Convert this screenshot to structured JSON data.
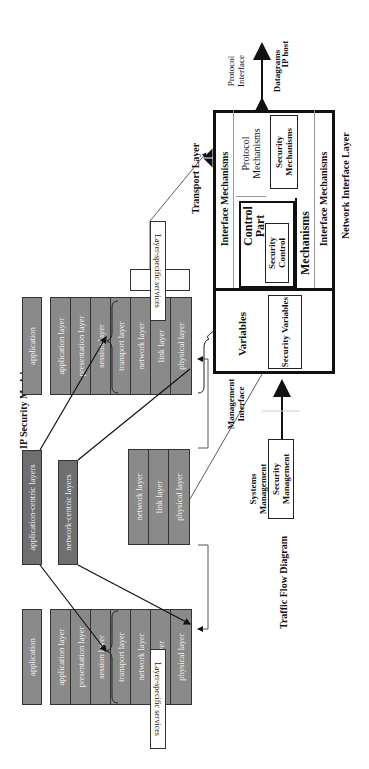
{
  "titles": {
    "security_model": "IP Security Model",
    "traffic_flow": "Traffic Flow Diagram"
  },
  "left_stack": {
    "application": "application",
    "layers": [
      "application layer",
      "presentation layer",
      "session layer",
      "transport layer",
      "network layer",
      "link layer",
      "physical layer"
    ],
    "services_label": "Layer-specific services"
  },
  "right_stack": {
    "application": "application",
    "layers": [
      "application layer",
      "presentation layer",
      "session layer",
      "transport layer",
      "network layer",
      "link layer",
      "physical layer"
    ],
    "services_label": "Layer-specific services"
  },
  "centric": {
    "application_centric": "application-centric layers",
    "network_centric": "network-centric layers"
  },
  "middle_stack": {
    "layers": [
      "network layer",
      "link layer",
      "physical layer"
    ]
  },
  "security_model": {
    "transport_layer": "Transport Layer",
    "network_interface_layer": "Network Interface Layer",
    "interface_mechanisms_top": "Interface Mechanisms",
    "interface_mechanisms_bottom": "Interface Mechanisms",
    "protocol_mechanisms": "Protocol Mechanisms",
    "security_mechanisms": "Security Mechanisms",
    "control_part": "Control Part",
    "security_control": "Security Control",
    "mechanisms": "Mechanisms",
    "variables": "Variables",
    "security_variables": "Security Variables",
    "protocol_interface": "Protocol Interface",
    "datagrams": "Datagrams",
    "ip_host": "IP host",
    "management_interface": "Management Interface",
    "systems_management": "Systems Management",
    "security_management": "Security Management"
  },
  "colors": {
    "layer_gray": "#8a8a8a",
    "centric_gray": "#6f6f6f",
    "line": "#111111"
  }
}
